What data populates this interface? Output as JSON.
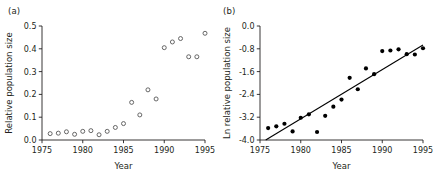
{
  "figure": {
    "panels": [
      {
        "label": "(a)",
        "xlabel": "Year",
        "ylabel": "Relative population size"
      },
      {
        "label": "(b)",
        "xlabel": "Year",
        "ylabel": "Ln relative population size"
      }
    ]
  },
  "colors": {
    "axis": "#231f20",
    "open_marker_stroke": "#4d4d4d",
    "filled_marker": "#000000",
    "line": "#000000",
    "background": "#ffffff"
  },
  "chart_data": [
    {
      "type": "scatter",
      "panel": "(a)",
      "title": "",
      "xlabel": "Year",
      "ylabel": "Relative population size",
      "xlim": [
        1975,
        1995
      ],
      "ylim": [
        0.0,
        0.5
      ],
      "xticks": [
        1975,
        1980,
        1985,
        1990,
        1995
      ],
      "xticklabels": [
        "1975",
        "1980",
        "1985",
        "1990",
        "1995"
      ],
      "yticks": [
        0.0,
        0.1,
        0.2,
        0.3,
        0.4,
        0.5
      ],
      "yticklabels": [
        "0.0",
        "0.1",
        "0.2",
        "0.3",
        "0.4",
        "0.5"
      ],
      "grid": false,
      "legend": false,
      "marker": "open-circle",
      "x": [
        1976,
        1977,
        1978,
        1979,
        1980,
        1981,
        1982,
        1983,
        1984,
        1985,
        1986,
        1987,
        1988,
        1989,
        1990,
        1991,
        1992,
        1993,
        1994,
        1995
      ],
      "y": [
        0.028,
        0.03,
        0.036,
        0.025,
        0.038,
        0.041,
        0.023,
        0.038,
        0.055,
        0.072,
        0.165,
        0.11,
        0.22,
        0.18,
        0.405,
        0.43,
        0.445,
        0.365,
        0.365,
        0.468
      ]
    },
    {
      "type": "scatter",
      "panel": "(b)",
      "title": "",
      "xlabel": "Year",
      "ylabel": "Ln relative population size",
      "xlim": [
        1975,
        1995
      ],
      "ylim": [
        -4.0,
        0.0
      ],
      "xticks": [
        1975,
        1980,
        1985,
        1990,
        1995
      ],
      "xticklabels": [
        "1975",
        "1980",
        "1985",
        "1990",
        "1995"
      ],
      "yticks": [
        0.0,
        -0.8,
        -1.6,
        -2.4,
        -3.2,
        -4.0
      ],
      "yticklabels": [
        "0.0",
        "-0.8",
        "-1.6",
        "-2.4",
        "-3.2",
        "-4.0"
      ],
      "grid": false,
      "legend": false,
      "marker": "filled-circle",
      "x": [
        1976,
        1977,
        1978,
        1979,
        1980,
        1981,
        1982,
        1983,
        1984,
        1985,
        1986,
        1987,
        1988,
        1989,
        1990,
        1991,
        1992,
        1993,
        1994,
        1995
      ],
      "y": [
        -3.58,
        -3.52,
        -3.43,
        -3.7,
        -3.22,
        -3.1,
        -3.72,
        -3.15,
        -2.83,
        -2.58,
        -1.82,
        -2.22,
        -1.49,
        -1.69,
        -0.88,
        -0.86,
        -0.82,
        -0.99,
        -1.0,
        -0.78
      ],
      "fit_line": {
        "x": [
          1975.7,
          1995.0
        ],
        "y": [
          -4.0,
          -0.67
        ]
      }
    }
  ]
}
